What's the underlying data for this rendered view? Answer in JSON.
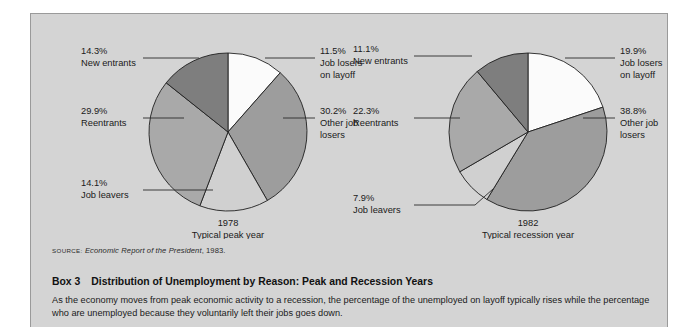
{
  "panel": {
    "background_color": "#d4d4d4",
    "border_color": "#9a9a9a"
  },
  "source": {
    "kicker": "SOURCE:",
    "title": "Economic Report of the President",
    "rest": ", 1983."
  },
  "box": {
    "number_label": "Box 3",
    "title": "Distribution of Unemployment by Reason: Peak and Recession Years",
    "body": "As the economy moves from peak economic activity to a recession, the percentage of the unemployed on layoff typically rises while the percentage who are unemployed because they voluntarily left their jobs goes down."
  },
  "chart_data": [
    {
      "type": "pie",
      "title": "1978",
      "subtitle": "Typical peak year",
      "categories": [
        "Job losers on layoff",
        "Other job losers",
        "Job leavers",
        "Reentrants",
        "New entrants"
      ],
      "values": [
        11.5,
        30.2,
        14.1,
        29.9,
        14.3
      ],
      "value_labels": [
        "11.5%",
        "30.2%",
        "14.1%",
        "29.9%",
        "14.3%"
      ],
      "label_lines": [
        [
          "11.5%",
          "Job losers",
          "on layoff"
        ],
        [
          "30.2%",
          "Other job",
          "losers"
        ],
        [
          "14.1%",
          "Job leavers"
        ],
        [
          "29.9%",
          "Reentrants"
        ],
        [
          "14.3%",
          "New entrants"
        ]
      ],
      "slice_colors": [
        "#fbfbfb",
        "#9d9d9d",
        "#d0d0d0",
        "#a9a9a9",
        "#7e7e7e"
      ],
      "start_angle_deg": 0,
      "legend": "none",
      "grid": false
    },
    {
      "type": "pie",
      "title": "1982",
      "subtitle": "Typical recession year",
      "categories": [
        "Job losers on layoff",
        "Other job losers",
        "Job leavers",
        "Reentrants",
        "New entrants"
      ],
      "values": [
        19.9,
        38.8,
        7.9,
        22.3,
        11.1
      ],
      "value_labels": [
        "19.9%",
        "38.8%",
        "7.9%",
        "22.3%",
        "11.1%"
      ],
      "label_lines": [
        [
          "19.9%",
          "Job losers",
          "on layoff"
        ],
        [
          "38.8%",
          "Other job",
          "losers"
        ],
        [
          "7.9%",
          "Job leavers"
        ],
        [
          "22.3%",
          "Reentrants"
        ],
        [
          "11.1%",
          "New entrants"
        ]
      ],
      "slice_colors": [
        "#fbfbfb",
        "#9d9d9d",
        "#d0d0d0",
        "#a9a9a9",
        "#7e7e7e"
      ],
      "start_angle_deg": 0,
      "legend": "none",
      "grid": false
    }
  ]
}
